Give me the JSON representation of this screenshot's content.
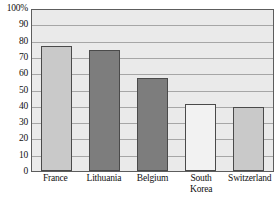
{
  "chart_data": {
    "type": "bar",
    "title": "",
    "xlabel": "",
    "ylabel": "",
    "categories": [
      "France",
      "Lithuania",
      "Belgium",
      "South Korea",
      "Switzerland"
    ],
    "values": [
      77,
      74,
      57,
      41,
      39
    ],
    "bar_colors": [
      "#c9c9c9",
      "#7d7d7d",
      "#7d7d7d",
      "#f2f2f2",
      "#c9c9c9"
    ],
    "ylim": [
      0,
      100
    ],
    "y_ticks": [
      "100%",
      "90",
      "80",
      "70",
      "60",
      "50",
      "40",
      "30",
      "20",
      "10",
      "0"
    ],
    "y_tick_values": [
      100,
      90,
      80,
      70,
      60,
      50,
      40,
      30,
      20,
      10,
      0
    ],
    "grid": true,
    "legend": "none",
    "plot_background": "#eaeaea",
    "gridline_color": "#a6a6a6",
    "axis_color": "#5d5d5d"
  },
  "x_labels": [
    {
      "line1": "France",
      "line2": ""
    },
    {
      "line1": "Lithuania",
      "line2": ""
    },
    {
      "line1": "Belgium",
      "line2": ""
    },
    {
      "line1": "South",
      "line2": "Korea"
    },
    {
      "line1": "Switzerland",
      "line2": ""
    }
  ]
}
